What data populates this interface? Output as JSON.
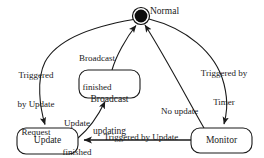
{
  "diagram": {
    "type": "state-machine",
    "canvas": {
      "width": 264,
      "height": 158,
      "background": "#ffffff"
    },
    "stroke_color": "#1a1a1a",
    "states": [
      {
        "id": "normal",
        "label": "Normal",
        "shape": "filled-circle-with-ring",
        "cx": 141,
        "cy": 16,
        "r_outer": 8.5,
        "r_inner": 6.3,
        "fill": "#0d0d0d",
        "label_x": 151,
        "label_y": 7
      },
      {
        "id": "broadcast_updating",
        "label": "Broadcast\nupdating",
        "line1": "Broadcast",
        "line2": "updating",
        "shape": "rounded-rect",
        "x": 79,
        "y": 70,
        "w": 61,
        "h": 28,
        "rx": 9
      },
      {
        "id": "update",
        "label": "Update",
        "shape": "rounded-rect",
        "x": 17,
        "y": 128,
        "w": 61,
        "h": 26,
        "rx": 9
      },
      {
        "id": "monitor",
        "label": "Monitor",
        "shape": "rounded-rect",
        "x": 191,
        "y": 128,
        "w": 61,
        "h": 25,
        "rx": 9
      }
    ],
    "transitions": [
      {
        "id": "normal-to-update",
        "from": "normal",
        "to": "update",
        "label": "Triggered\nby Update\nRequest",
        "label_lines": [
          "Triggered",
          "by Update",
          "Request"
        ],
        "label_x": 13,
        "label_y": 54,
        "arrowhead": "at-target"
      },
      {
        "id": "broadcast-to-normal",
        "from": "broadcast_updating",
        "to": "normal",
        "label": "Broadcast\nfinished",
        "label_lines": [
          "Broadcast",
          "finished"
        ],
        "label_x": 74,
        "label_y": 36,
        "arrowhead": "at-target"
      },
      {
        "id": "update-to-broadcast",
        "from": "update",
        "to": "broadcast_updating",
        "label": "Update\nfinished",
        "label_lines": [
          "Update",
          "finished"
        ],
        "label_x": 58,
        "label_y": 101,
        "arrowhead": "at-target"
      },
      {
        "id": "monitor-to-update",
        "from": "monitor",
        "to": "update",
        "label": "Triggered by Update\nInfo",
        "label_lines": [
          "Triggered by Update",
          "Info"
        ],
        "label_x": 101,
        "label_y": 114,
        "arrowhead": "at-target"
      },
      {
        "id": "monitor-to-normal",
        "from": "monitor",
        "to": "normal",
        "label": "No update",
        "label_lines": [
          "No update"
        ],
        "label_x": 162,
        "label_y": 88,
        "arrowhead": "at-target"
      },
      {
        "id": "normal-to-monitor",
        "from": "normal",
        "to": "monitor",
        "label": "Triggered by\nTimer",
        "label_lines": [
          "Triggered by",
          "Timer"
        ],
        "label_x": 197,
        "label_y": 51,
        "arrowhead": "at-target"
      }
    ]
  }
}
